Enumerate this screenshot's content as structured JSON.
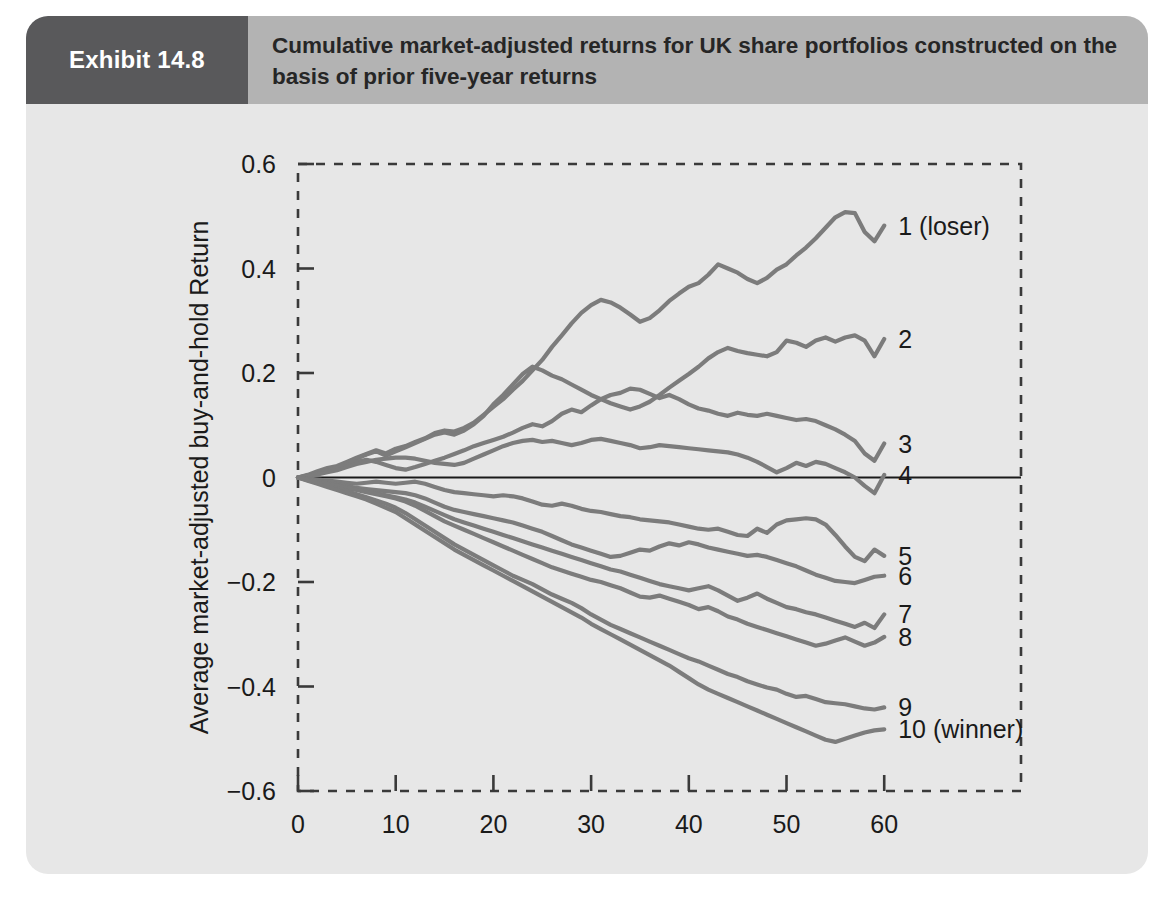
{
  "exhibit": {
    "tag": "Exhibit 14.8",
    "title": "Cumulative market-adjusted returns for UK share portfolios constructed on the basis of prior five-year returns"
  },
  "colors": {
    "panel_background": "#e7e7e7",
    "header_band": "#b3b3b3",
    "header_tag": "#59595b",
    "line": "#7c7c7c",
    "zero_line": "#1a1a1a",
    "axis": "#3a3a3a",
    "text": "#1a1a1a"
  },
  "chart_data": {
    "type": "line",
    "title": "Cumulative market-adjusted returns for UK share portfolios constructed on the basis of prior five-year returns",
    "xlabel": "Months since portfolio formation",
    "ylabel": "Average market-adjusted buy-and-hold Return",
    "xlim": [
      0,
      74
    ],
    "ylim": [
      -0.6,
      0.6
    ],
    "xticks": [
      0,
      10,
      20,
      30,
      40,
      50,
      60
    ],
    "xtick_labels": [
      "0",
      "10",
      "20",
      "30",
      "40",
      "50",
      "60"
    ],
    "yticks": [
      0.6,
      0.4,
      0.2,
      0,
      -0.2,
      -0.4,
      -0.6
    ],
    "ytick_labels": [
      "0.6",
      "0.4",
      "0.2",
      "0",
      "−0.2",
      "−0.4",
      "−0.6"
    ],
    "grid": false,
    "legend_position": "right-inline",
    "zero_reference_line": 0,
    "axis_style": "dashed-box",
    "x": [
      0,
      1,
      2,
      3,
      4,
      5,
      6,
      7,
      8,
      9,
      10,
      11,
      12,
      13,
      14,
      15,
      16,
      17,
      18,
      19,
      20,
      21,
      22,
      23,
      24,
      25,
      26,
      27,
      28,
      29,
      30,
      31,
      32,
      33,
      34,
      35,
      36,
      37,
      38,
      39,
      40,
      41,
      42,
      43,
      44,
      45,
      46,
      47,
      48,
      49,
      50,
      51,
      52,
      53,
      54,
      55,
      56,
      57,
      58,
      59,
      60
    ],
    "series": [
      {
        "name": "1 (loser)",
        "label": "1 (loser)",
        "end_value": 0.48,
        "values": [
          0,
          0.005,
          0.012,
          0.018,
          0.022,
          0.03,
          0.038,
          0.045,
          0.052,
          0.046,
          0.055,
          0.06,
          0.068,
          0.075,
          0.085,
          0.09,
          0.088,
          0.095,
          0.105,
          0.12,
          0.135,
          0.15,
          0.168,
          0.185,
          0.205,
          0.225,
          0.25,
          0.272,
          0.295,
          0.315,
          0.33,
          0.34,
          0.335,
          0.325,
          0.312,
          0.298,
          0.305,
          0.32,
          0.338,
          0.352,
          0.365,
          0.372,
          0.388,
          0.408,
          0.4,
          0.392,
          0.38,
          0.372,
          0.382,
          0.398,
          0.408,
          0.425,
          0.44,
          0.458,
          0.478,
          0.498,
          0.508,
          0.506,
          0.47,
          0.452,
          0.482
        ]
      },
      {
        "name": "2",
        "label": "2",
        "end_value": 0.265,
        "values": [
          0,
          0.004,
          0.01,
          0.015,
          0.02,
          0.028,
          0.036,
          0.044,
          0.05,
          0.042,
          0.05,
          0.058,
          0.066,
          0.074,
          0.082,
          0.086,
          0.082,
          0.09,
          0.102,
          0.118,
          0.14,
          0.158,
          0.178,
          0.198,
          0.212,
          0.205,
          0.195,
          0.188,
          0.178,
          0.168,
          0.158,
          0.15,
          0.142,
          0.136,
          0.13,
          0.136,
          0.145,
          0.158,
          0.172,
          0.185,
          0.198,
          0.212,
          0.228,
          0.24,
          0.248,
          0.242,
          0.238,
          0.235,
          0.232,
          0.24,
          0.262,
          0.258,
          0.25,
          0.262,
          0.268,
          0.26,
          0.268,
          0.272,
          0.262,
          0.232,
          0.265
        ]
      },
      {
        "name": "3",
        "label": "3",
        "end_value": 0.065,
        "values": [
          0,
          0.003,
          0.008,
          0.013,
          0.018,
          0.024,
          0.03,
          0.034,
          0.03,
          0.024,
          0.018,
          0.015,
          0.02,
          0.026,
          0.032,
          0.038,
          0.045,
          0.052,
          0.06,
          0.066,
          0.072,
          0.078,
          0.086,
          0.095,
          0.102,
          0.098,
          0.108,
          0.122,
          0.13,
          0.125,
          0.138,
          0.15,
          0.158,
          0.162,
          0.17,
          0.168,
          0.16,
          0.152,
          0.158,
          0.15,
          0.14,
          0.132,
          0.128,
          0.122,
          0.118,
          0.124,
          0.12,
          0.118,
          0.122,
          0.118,
          0.114,
          0.11,
          0.112,
          0.108,
          0.1,
          0.092,
          0.082,
          0.07,
          0.046,
          0.032,
          0.065
        ]
      },
      {
        "name": "4",
        "label": "4",
        "end_value": 0.005,
        "values": [
          0,
          0.002,
          0.006,
          0.01,
          0.014,
          0.02,
          0.026,
          0.03,
          0.034,
          0.036,
          0.038,
          0.038,
          0.036,
          0.032,
          0.028,
          0.026,
          0.024,
          0.028,
          0.036,
          0.044,
          0.052,
          0.06,
          0.066,
          0.07,
          0.072,
          0.068,
          0.07,
          0.066,
          0.062,
          0.066,
          0.072,
          0.074,
          0.07,
          0.066,
          0.062,
          0.056,
          0.058,
          0.062,
          0.06,
          0.058,
          0.056,
          0.054,
          0.052,
          0.05,
          0.048,
          0.044,
          0.038,
          0.03,
          0.02,
          0.01,
          0.018,
          0.028,
          0.022,
          0.03,
          0.026,
          0.018,
          0.01,
          0.0,
          -0.016,
          -0.03,
          0.005
        ]
      },
      {
        "name": "5",
        "label": "5",
        "end_value": -0.15,
        "values": [
          0,
          -0.002,
          -0.004,
          -0.006,
          -0.008,
          -0.01,
          -0.012,
          -0.01,
          -0.008,
          -0.01,
          -0.012,
          -0.01,
          -0.008,
          -0.012,
          -0.018,
          -0.024,
          -0.028,
          -0.03,
          -0.032,
          -0.034,
          -0.036,
          -0.034,
          -0.036,
          -0.04,
          -0.046,
          -0.052,
          -0.054,
          -0.05,
          -0.054,
          -0.06,
          -0.064,
          -0.066,
          -0.07,
          -0.074,
          -0.076,
          -0.08,
          -0.082,
          -0.084,
          -0.086,
          -0.09,
          -0.094,
          -0.098,
          -0.1,
          -0.098,
          -0.104,
          -0.11,
          -0.112,
          -0.098,
          -0.106,
          -0.09,
          -0.082,
          -0.08,
          -0.078,
          -0.08,
          -0.09,
          -0.11,
          -0.132,
          -0.152,
          -0.16,
          -0.138,
          -0.15
        ]
      },
      {
        "name": "6",
        "label": "6",
        "end_value": -0.188,
        "values": [
          0,
          -0.003,
          -0.006,
          -0.009,
          -0.012,
          -0.016,
          -0.02,
          -0.022,
          -0.024,
          -0.026,
          -0.028,
          -0.03,
          -0.034,
          -0.04,
          -0.048,
          -0.056,
          -0.062,
          -0.066,
          -0.07,
          -0.074,
          -0.078,
          -0.082,
          -0.086,
          -0.092,
          -0.098,
          -0.104,
          -0.112,
          -0.12,
          -0.128,
          -0.134,
          -0.14,
          -0.146,
          -0.152,
          -0.15,
          -0.144,
          -0.138,
          -0.14,
          -0.132,
          -0.126,
          -0.13,
          -0.124,
          -0.128,
          -0.134,
          -0.138,
          -0.142,
          -0.146,
          -0.15,
          -0.148,
          -0.152,
          -0.158,
          -0.164,
          -0.17,
          -0.178,
          -0.186,
          -0.192,
          -0.198,
          -0.2,
          -0.202,
          -0.196,
          -0.19,
          -0.188
        ]
      },
      {
        "name": "7",
        "label": "7",
        "end_value": -0.262,
        "values": [
          0,
          -0.003,
          -0.007,
          -0.011,
          -0.015,
          -0.019,
          -0.023,
          -0.026,
          -0.03,
          -0.034,
          -0.038,
          -0.042,
          -0.048,
          -0.056,
          -0.064,
          -0.072,
          -0.08,
          -0.086,
          -0.092,
          -0.098,
          -0.104,
          -0.11,
          -0.116,
          -0.122,
          -0.128,
          -0.134,
          -0.14,
          -0.146,
          -0.152,
          -0.158,
          -0.164,
          -0.17,
          -0.176,
          -0.18,
          -0.186,
          -0.192,
          -0.198,
          -0.204,
          -0.208,
          -0.212,
          -0.216,
          -0.212,
          -0.208,
          -0.216,
          -0.226,
          -0.236,
          -0.23,
          -0.222,
          -0.232,
          -0.24,
          -0.248,
          -0.252,
          -0.258,
          -0.262,
          -0.268,
          -0.274,
          -0.28,
          -0.286,
          -0.278,
          -0.288,
          -0.262
        ]
      },
      {
        "name": "8",
        "label": "8",
        "end_value": -0.305,
        "values": [
          0,
          -0.004,
          -0.008,
          -0.012,
          -0.016,
          -0.02,
          -0.024,
          -0.028,
          -0.032,
          -0.036,
          -0.04,
          -0.046,
          -0.054,
          -0.064,
          -0.074,
          -0.084,
          -0.092,
          -0.1,
          -0.108,
          -0.116,
          -0.124,
          -0.132,
          -0.14,
          -0.148,
          -0.156,
          -0.164,
          -0.172,
          -0.178,
          -0.184,
          -0.19,
          -0.196,
          -0.2,
          -0.206,
          -0.212,
          -0.22,
          -0.228,
          -0.23,
          -0.226,
          -0.232,
          -0.238,
          -0.244,
          -0.252,
          -0.248,
          -0.256,
          -0.266,
          -0.272,
          -0.28,
          -0.286,
          -0.292,
          -0.298,
          -0.304,
          -0.31,
          -0.316,
          -0.322,
          -0.318,
          -0.312,
          -0.306,
          -0.314,
          -0.322,
          -0.316,
          -0.305
        ]
      },
      {
        "name": "9",
        "label": "9",
        "end_value": -0.44,
        "values": [
          0,
          -0.005,
          -0.01,
          -0.015,
          -0.02,
          -0.026,
          -0.032,
          -0.038,
          -0.044,
          -0.05,
          -0.058,
          -0.068,
          -0.08,
          -0.092,
          -0.104,
          -0.116,
          -0.128,
          -0.138,
          -0.148,
          -0.158,
          -0.168,
          -0.178,
          -0.188,
          -0.196,
          -0.204,
          -0.214,
          -0.224,
          -0.232,
          -0.24,
          -0.25,
          -0.262,
          -0.272,
          -0.282,
          -0.29,
          -0.298,
          -0.306,
          -0.314,
          -0.322,
          -0.33,
          -0.338,
          -0.346,
          -0.352,
          -0.36,
          -0.368,
          -0.376,
          -0.382,
          -0.39,
          -0.396,
          -0.402,
          -0.406,
          -0.414,
          -0.42,
          -0.418,
          -0.424,
          -0.43,
          -0.432,
          -0.434,
          -0.438,
          -0.442,
          -0.444,
          -0.44
        ]
      },
      {
        "name": "10 (winner)",
        "label": "10 (winner)",
        "end_value": -0.482,
        "values": [
          0,
          -0.006,
          -0.012,
          -0.018,
          -0.024,
          -0.03,
          -0.036,
          -0.042,
          -0.05,
          -0.058,
          -0.066,
          -0.078,
          -0.09,
          -0.102,
          -0.114,
          -0.126,
          -0.138,
          -0.148,
          -0.158,
          -0.168,
          -0.178,
          -0.188,
          -0.198,
          -0.208,
          -0.218,
          -0.228,
          -0.238,
          -0.248,
          -0.258,
          -0.268,
          -0.28,
          -0.29,
          -0.3,
          -0.31,
          -0.32,
          -0.33,
          -0.34,
          -0.35,
          -0.36,
          -0.372,
          -0.384,
          -0.396,
          -0.406,
          -0.414,
          -0.422,
          -0.43,
          -0.438,
          -0.446,
          -0.454,
          -0.462,
          -0.47,
          -0.478,
          -0.486,
          -0.494,
          -0.502,
          -0.506,
          -0.5,
          -0.494,
          -0.488,
          -0.484,
          -0.482
        ]
      }
    ]
  }
}
